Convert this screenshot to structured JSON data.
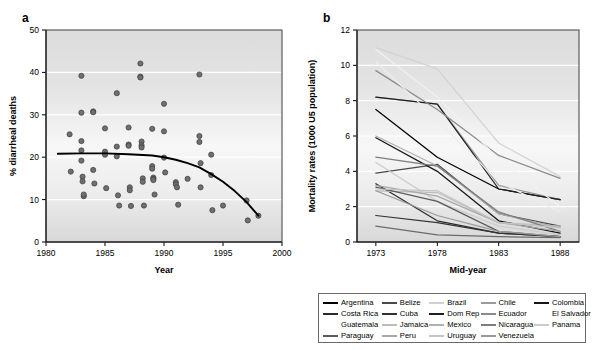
{
  "figure": {
    "panel_a_label": "a",
    "panel_b_label": "b"
  },
  "chart_data": [
    {
      "id": "panel_a",
      "type": "scatter",
      "title": "",
      "xlabel": "Year",
      "ylabel": "% diarrheal deaths",
      "xlim": [
        1980,
        2000
      ],
      "ylim": [
        0,
        50
      ],
      "xticks": [
        1980,
        1985,
        1990,
        1995,
        2000
      ],
      "xticklabels": [
        "1980",
        "1985",
        "1990",
        "1995",
        "2000"
      ],
      "yticks": [
        0,
        10,
        20,
        30,
        40,
        50
      ],
      "yticklabels": [
        "0",
        "10",
        "20",
        "30",
        "40",
        "50"
      ],
      "grid": "horizontal-white-bands",
      "legend": "none",
      "marker_color": "#6f6f6f",
      "points": [
        [
          1982.0,
          25.4
        ],
        [
          1982.1,
          16.6
        ],
        [
          1983.0,
          39.2
        ],
        [
          1983.0,
          30.5
        ],
        [
          1983.0,
          23.8
        ],
        [
          1983.0,
          21.6
        ],
        [
          1983.0,
          19.2
        ],
        [
          1983.1,
          15.4
        ],
        [
          1983.1,
          14.3
        ],
        [
          1983.2,
          10.8
        ],
        [
          1983.2,
          11.2
        ],
        [
          1984.0,
          30.8
        ],
        [
          1984.0,
          30.6
        ],
        [
          1984.0,
          17.0
        ],
        [
          1984.1,
          13.8
        ],
        [
          1985.0,
          26.8
        ],
        [
          1985.0,
          21.3
        ],
        [
          1985.0,
          20.6
        ],
        [
          1985.1,
          12.7
        ],
        [
          1986.0,
          35.1
        ],
        [
          1986.0,
          22.5
        ],
        [
          1986.0,
          20.2
        ],
        [
          1986.1,
          11.0
        ],
        [
          1986.2,
          8.6
        ],
        [
          1987.0,
          27.0
        ],
        [
          1987.0,
          23.0
        ],
        [
          1987.0,
          22.7
        ],
        [
          1987.1,
          12.9
        ],
        [
          1987.1,
          12.2
        ],
        [
          1987.2,
          8.5
        ],
        [
          1988.0,
          42.1
        ],
        [
          1988.0,
          39.0
        ],
        [
          1988.0,
          38.8
        ],
        [
          1988.1,
          23.7
        ],
        [
          1988.1,
          22.8
        ],
        [
          1988.1,
          22.3
        ],
        [
          1988.2,
          15.0
        ],
        [
          1988.2,
          14.2
        ],
        [
          1988.3,
          8.6
        ],
        [
          1989.0,
          26.7
        ],
        [
          1989.0,
          17.9
        ],
        [
          1989.0,
          17.3
        ],
        [
          1989.1,
          15.2
        ],
        [
          1989.1,
          14.9
        ],
        [
          1989.1,
          14.6
        ],
        [
          1989.2,
          11.2
        ],
        [
          1990.0,
          32.6
        ],
        [
          1990.0,
          26.1
        ],
        [
          1990.0,
          19.9
        ],
        [
          1990.1,
          16.4
        ],
        [
          1991.0,
          14.1
        ],
        [
          1991.0,
          13.6
        ],
        [
          1991.1,
          12.9
        ],
        [
          1991.2,
          8.8
        ],
        [
          1992.0,
          14.9
        ],
        [
          1993.0,
          39.5
        ],
        [
          1993.0,
          25.0
        ],
        [
          1993.0,
          23.6
        ],
        [
          1993.1,
          18.6
        ],
        [
          1993.1,
          12.9
        ],
        [
          1994.0,
          20.6
        ],
        [
          1994.0,
          15.8
        ],
        [
          1994.1,
          7.5
        ],
        [
          1995.0,
          8.6
        ],
        [
          1997.0,
          9.8
        ],
        [
          1997.1,
          5.1
        ],
        [
          1998.0,
          6.2
        ]
      ],
      "trend_line": {
        "label": "fitted trend",
        "color": "#000000",
        "points": [
          [
            1981.0,
            20.8
          ],
          [
            1983.0,
            20.9
          ],
          [
            1985.0,
            20.9
          ],
          [
            1987.0,
            20.7
          ],
          [
            1989.0,
            20.4
          ],
          [
            1990.0,
            20.0
          ],
          [
            1991.0,
            19.4
          ],
          [
            1992.0,
            18.6
          ],
          [
            1993.0,
            17.6
          ],
          [
            1994.0,
            16.0
          ],
          [
            1995.0,
            14.2
          ],
          [
            1996.0,
            12.0
          ],
          [
            1997.0,
            9.4
          ],
          [
            1998.0,
            6.2
          ]
        ]
      }
    },
    {
      "id": "panel_b",
      "type": "line",
      "title": "",
      "xlabel": "Mid-year",
      "ylabel": "Mortality rates (1000 U5 population)",
      "x": [
        1973,
        1978,
        1983,
        1988
      ],
      "xticklabels": [
        "1973",
        "1978",
        "1983",
        "1988"
      ],
      "ylim": [
        0,
        12
      ],
      "yticks": [
        0,
        2,
        4,
        6,
        8,
        10,
        12
      ],
      "yticklabels": [
        "0",
        "2",
        "4",
        "6",
        "8",
        "10",
        "12"
      ],
      "grid": "horizontal-white-bands",
      "legend_position": "below",
      "series": [
        {
          "name": "Argentina",
          "color": "#000000",
          "values": [
            7.5,
            4.8,
            3.0,
            2.4
          ]
        },
        {
          "name": "Belize",
          "color": "#4a4a4a",
          "values": [
            3.9,
            4.4,
            1.6,
            0.9
          ]
        },
        {
          "name": "Brazil",
          "color": "#d2d2d2",
          "values": [
            11.0,
            9.8,
            5.6,
            3.7
          ]
        },
        {
          "name": "Chile",
          "color": "#9a9a9a",
          "values": [
            8.2,
            7.8,
            3.2,
            2.4
          ]
        },
        {
          "name": "Colombia",
          "color": "#161616",
          "values": [
            5.9,
            4.0,
            1.2,
            0.5
          ]
        },
        {
          "name": "Costa Rica",
          "color": "#2b2b2b",
          "values": [
            3.3,
            1.2,
            0.5,
            0.3
          ]
        },
        {
          "name": "Cuba",
          "color": "#333333",
          "values": [
            1.5,
            1.1,
            0.5,
            0.3
          ]
        },
        {
          "name": "Dom Rep",
          "color": "#1f1f1f",
          "values": [
            8.2,
            7.8,
            3.0,
            2.4
          ]
        },
        {
          "name": "Ecuador",
          "color": "#8b8b8b",
          "values": [
            9.7,
            7.5,
            4.9,
            3.6
          ]
        },
        {
          "name": "El Salvador",
          "color": "#f2f2f2",
          "values": [
            10.9,
            8.2,
            4.7,
            2.0
          ]
        },
        {
          "name": "Guatemala",
          "color": "#ededed",
          "values": [
            10.2,
            6.9,
            3.4,
            1.7
          ]
        },
        {
          "name": "Jamaica",
          "color": "#bdbdbd",
          "values": [
            2.9,
            2.8,
            1.1,
            0.9
          ]
        },
        {
          "name": "Mexico",
          "color": "#b0b0b0",
          "values": [
            6.0,
            4.3,
            1.6,
            0.8
          ]
        },
        {
          "name": "Nicaragua",
          "color": "#7d7d7d",
          "values": [
            4.8,
            4.3,
            1.7,
            0.6
          ]
        },
        {
          "name": "Panama",
          "color": "#cccccc",
          "values": [
            4.5,
            2.3,
            0.9,
            0.4
          ]
        },
        {
          "name": "Paraguay",
          "color": "#5c5c5c",
          "values": [
            3.1,
            2.3,
            0.6,
            0.3
          ]
        },
        {
          "name": "Peru",
          "color": "#a8a8a8",
          "values": [
            3.2,
            2.6,
            1.1,
            0.6
          ]
        },
        {
          "name": "Uruguay",
          "color": "#c4c4c4",
          "values": [
            3.0,
            2.9,
            1.1,
            0.8
          ]
        },
        {
          "name": "Venezuela",
          "color": "#999999",
          "values": [
            2.9,
            1.5,
            0.6,
            0.3
          ]
        },
        {
          "name": "Bolivia",
          "color": "#6b6b6b",
          "values": [
            0.9,
            0.4,
            0.3,
            0.25
          ]
        }
      ]
    }
  ],
  "legend": {
    "columns": [
      {
        "items": [
          {
            "label": "Argentina",
            "color": "#000000",
            "visible_swatch": true
          },
          {
            "label": "Costa Rica",
            "color": "#2b2b2b",
            "visible_swatch": true
          },
          {
            "label": "Guatemala",
            "color": "#ededed",
            "visible_swatch": false
          },
          {
            "label": "Paraguay",
            "color": "#5c5c5c",
            "visible_swatch": true
          }
        ]
      },
      {
        "items": [
          {
            "label": "Belize",
            "color": "#4a4a4a",
            "visible_swatch": true
          },
          {
            "label": "Cuba",
            "color": "#333333",
            "visible_swatch": true
          },
          {
            "label": "Jamaica",
            "color": "#bdbdbd",
            "visible_swatch": true
          },
          {
            "label": "Peru",
            "color": "#a8a8a8",
            "visible_swatch": true
          }
        ]
      },
      {
        "items": [
          {
            "label": "Brazil",
            "color": "#d2d2d2",
            "visible_swatch": true
          },
          {
            "label": "Dom Rep",
            "color": "#1f1f1f",
            "visible_swatch": true
          },
          {
            "label": "Mexico",
            "color": "#b0b0b0",
            "visible_swatch": true
          },
          {
            "label": "Uruguay",
            "color": "#c4c4c4",
            "visible_swatch": true
          }
        ]
      },
      {
        "items": [
          {
            "label": "Chile",
            "color": "#9a9a9a",
            "visible_swatch": true
          },
          {
            "label": "Ecuador",
            "color": "#8b8b8b",
            "visible_swatch": true
          },
          {
            "label": "Nicaragua",
            "color": "#7d7d7d",
            "visible_swatch": true
          },
          {
            "label": "Venezuela",
            "color": "#999999",
            "visible_swatch": true
          }
        ]
      },
      {
        "items": [
          {
            "label": "Colombia",
            "color": "#161616",
            "visible_swatch": true
          },
          {
            "label": "El Salvador",
            "color": "#ffffff",
            "visible_swatch": false
          },
          {
            "label": "Panama",
            "color": "#cccccc",
            "visible_swatch": true
          }
        ]
      }
    ]
  }
}
